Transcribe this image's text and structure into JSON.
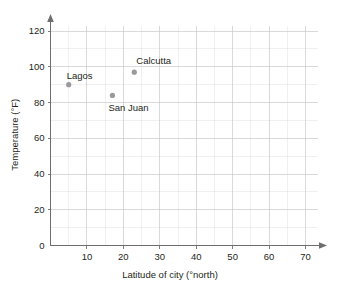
{
  "chart_data": {
    "type": "scatter",
    "title": "",
    "xlabel": "Latitude of city (°north)",
    "ylabel": "Temperature (°F)",
    "xlim": [
      0,
      75
    ],
    "ylim": [
      0,
      127
    ],
    "xticks": [
      10,
      20,
      30,
      40,
      50,
      60,
      70
    ],
    "xtick_labels": [
      "10",
      "20",
      "30",
      "40",
      "50",
      "60",
      "70"
    ],
    "yticks": [
      0,
      20,
      40,
      60,
      80,
      100,
      120
    ],
    "ytick_labels": [
      "0",
      "20",
      "40",
      "60",
      "80",
      "100",
      "120"
    ],
    "origin_label": "0",
    "grid": true,
    "grid_major_step_x": 10,
    "grid_minor_step_x": 5,
    "grid_major_step_y": 20,
    "grid_minor_step_y": 10,
    "legend": "none",
    "marker_color": "#9a9a9a",
    "axis_color": "#6d6e70",
    "grid_color": "#c9c9c9",
    "grid_minor_color": "#e2e2e2",
    "points": [
      {
        "label": "Lagos",
        "x": 5,
        "y": 90,
        "label_dx": -2,
        "label_dy": -14
      },
      {
        "label": "San Juan",
        "x": 17,
        "y": 84,
        "label_dx": -4,
        "label_dy": 8
      },
      {
        "label": "Calcutta",
        "x": 23,
        "y": 97,
        "label_dx": 2,
        "label_dy": -16
      }
    ]
  }
}
